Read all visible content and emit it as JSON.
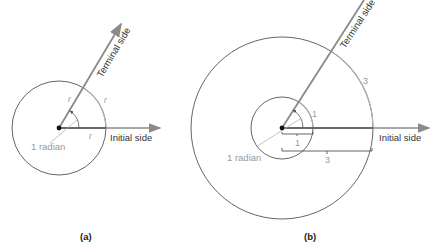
{
  "figure_a": {
    "caption": "(a)",
    "terminal_label": "Terminal side",
    "initial_label": "Initial side",
    "angle_label": "1 radian",
    "radius_labels": [
      "r",
      "r",
      "r"
    ]
  },
  "figure_b": {
    "caption": "(b)",
    "terminal_label": "Terminal side",
    "initial_label": "Initial side",
    "angle_label": "1 radian",
    "small_arc_label": "1",
    "small_radius_label": "1",
    "large_arc_label": "3",
    "large_radius_label": "3"
  },
  "colors": {
    "circle": "#555555",
    "ray": "#8a8a8a",
    "arc_highlight": "#a8a8a8",
    "text_dark": "#333333",
    "text_light": "#999999"
  }
}
